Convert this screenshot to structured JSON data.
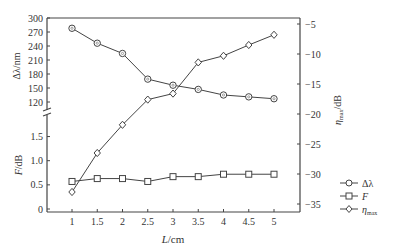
{
  "chart_data": {
    "type": "line",
    "title": "",
    "xlabel": "L/cm",
    "x": [
      1,
      1.5,
      2,
      2.5,
      3,
      3.5,
      4,
      4.5,
      5
    ],
    "x_ticks": [
      "1",
      "1.5",
      "2",
      "2.5",
      "3",
      "3.5",
      "4",
      "4.5",
      "5"
    ],
    "axes": {
      "left_top": {
        "label": "Δλ/nm",
        "range": [
          100,
          300
        ],
        "ticks": [
          120,
          150,
          180,
          210,
          240,
          270,
          300
        ]
      },
      "left_bottom": {
        "label": "F/dB",
        "range": [
          0,
          1.9
        ],
        "ticks": [
          "0",
          "0.5",
          "1.0",
          "1.5"
        ]
      },
      "right": {
        "label": "η_max/dB",
        "range": [
          -36,
          -2
        ],
        "ticks": [
          -5,
          -10,
          -15,
          -20,
          -25,
          -30,
          -35
        ]
      }
    },
    "series": [
      {
        "name": "Δλ",
        "marker": "circle",
        "axis": "left_top",
        "values": [
          278,
          246,
          224,
          169,
          156,
          147,
          135,
          131,
          127
        ]
      },
      {
        "name": "F",
        "marker": "square",
        "axis": "left_bottom",
        "values": [
          0.57,
          0.63,
          0.63,
          0.57,
          0.67,
          0.67,
          0.72,
          0.72,
          0.72
        ]
      },
      {
        "name": "η_max",
        "marker": "diamond",
        "axis": "right",
        "values": [
          -33,
          -26.5,
          -21.8,
          -17.6,
          -16.6,
          -11.4,
          -10.3,
          -8.5,
          -6.8
        ]
      }
    ],
    "legend": {
      "position": "lower-right",
      "entries": [
        "Δλ",
        "F",
        "ηmax"
      ]
    },
    "grid": false,
    "axis_break": "left axis between 120 and 1.5"
  },
  "labels": {
    "xlabel_italic": "L",
    "xlabel_unit": "/cm",
    "ylabel_top": "Δλ/nm",
    "ylabel_bottom_italic": "F",
    "ylabel_bottom_unit": "/dB",
    "ylabel_right_main": "η",
    "ylabel_right_sub": "max",
    "ylabel_right_unit": "/dB",
    "legend_1": "Δλ",
    "legend_2": "F",
    "legend_3_main": "η",
    "legend_3_sub": "max"
  }
}
